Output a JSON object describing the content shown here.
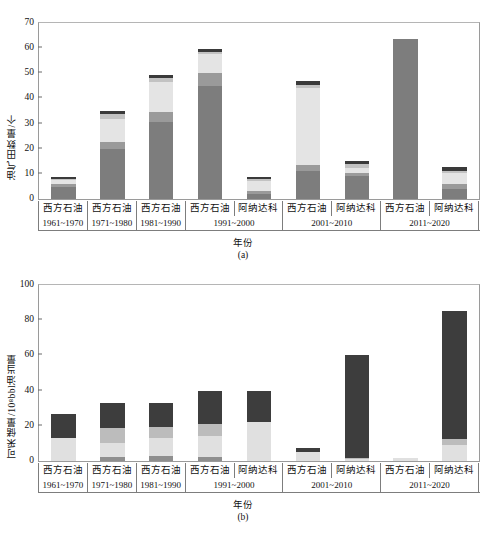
{
  "header": {
    "cropped_text": "                                                                                                                          "
  },
  "figure": {
    "caption_a": "(a)",
    "caption_b": "(b)"
  },
  "chart_data": [
    {
      "type": "bar",
      "id": "panel-a",
      "stacked": true,
      "title": "",
      "subtitle": "(a)",
      "xlabel": "年份",
      "ylabel": "油气田数量/个",
      "ylim": [
        0,
        70
      ],
      "yticks": [
        0,
        10,
        20,
        30,
        40,
        50,
        60,
        70
      ],
      "grid": false,
      "legend_position": "none",
      "categories": [
        "西方石油",
        "西方石油",
        "西方石油",
        "西方石油",
        "阿纳达科",
        "西方石油",
        "阿纳达科",
        "西方石油",
        "阿纳达科"
      ],
      "periods": [
        {
          "label": "1961~1970",
          "span": 1
        },
        {
          "label": "1971~1980",
          "span": 1
        },
        {
          "label": "1981~1990",
          "span": 1
        },
        {
          "label": "1991~2000",
          "span": 2
        },
        {
          "label": "2001~2010",
          "span": 2
        },
        {
          "label": "2011~2020",
          "span": 2
        }
      ],
      "series": [
        {
          "name": "S1",
          "color": "#7d7d7d",
          "values": [
            4.8,
            19.8,
            30.5,
            45.0,
            2.0,
            11.0,
            9.0,
            63.5,
            4.0
          ]
        },
        {
          "name": "S2",
          "color": "#9a9a9a",
          "values": [
            1.2,
            3.0,
            4.0,
            5.0,
            1.2,
            2.5,
            1.5,
            0.0,
            2.0
          ]
        },
        {
          "name": "S3",
          "color": "#e4e4e4",
          "values": [
            1.5,
            9.0,
            12.0,
            7.5,
            4.0,
            30.5,
            2.0,
            0.0,
            4.5
          ]
        },
        {
          "name": "S4",
          "color": "#c2c2c2",
          "values": [
            0.5,
            2.2,
            1.5,
            1.0,
            0.8,
            1.5,
            1.5,
            0.0,
            0.8
          ]
        },
        {
          "name": "S5",
          "color": "#3a3a3a",
          "values": [
            0.8,
            1.0,
            1.5,
            1.0,
            0.8,
            1.5,
            1.0,
            0.0,
            1.5
          ]
        }
      ],
      "totals": [
        8.8,
        35.0,
        49.5,
        59.5,
        8.8,
        47.0,
        15.0,
        63.5,
        12.8
      ]
    },
    {
      "type": "bar",
      "id": "panel-b",
      "stacked": true,
      "title": "",
      "subtitle": "(b)",
      "xlabel": "年份",
      "ylabel": "可采储量/10⁸bbl油当量",
      "ylim": [
        0,
        100
      ],
      "yticks": [
        0,
        20,
        40,
        60,
        80,
        100
      ],
      "grid": false,
      "legend_position": "none",
      "categories": [
        "西方石油",
        "西方石油",
        "西方石油",
        "西方石油",
        "阿纳达科",
        "西方石油",
        "阿纳达科",
        "西方石油",
        "阿纳达科"
      ],
      "periods": [
        {
          "label": "1961~1970",
          "span": 1
        },
        {
          "label": "1971~1980",
          "span": 1
        },
        {
          "label": "1981~1990",
          "span": 1
        },
        {
          "label": "1991~2000",
          "span": 2
        },
        {
          "label": "2001~2010",
          "span": 2
        },
        {
          "label": "2011~2020",
          "span": 2
        }
      ],
      "series": [
        {
          "name": "S1",
          "color": "#8f8f8f",
          "values": [
            0.0,
            2.5,
            3.0,
            2.0,
            0.0,
            0.0,
            0.0,
            0.0,
            0.0
          ]
        },
        {
          "name": "S2",
          "color": "#e0e0e0",
          "values": [
            13.0,
            8.0,
            10.0,
            12.0,
            22.0,
            5.0,
            1.0,
            1.5,
            9.0
          ]
        },
        {
          "name": "S3",
          "color": "#bcbcbc",
          "values": [
            0.0,
            8.5,
            6.5,
            7.0,
            0.0,
            0.0,
            1.0,
            0.0,
            3.5
          ]
        },
        {
          "name": "S4",
          "color": "#3d3d3d",
          "values": [
            13.5,
            14.0,
            13.5,
            19.0,
            18.0,
            2.5,
            58.0,
            0.0,
            73.0
          ]
        }
      ],
      "totals": [
        26.5,
        33.0,
        33.0,
        40.0,
        40.0,
        7.5,
        60.0,
        1.5,
        85.5
      ]
    }
  ]
}
